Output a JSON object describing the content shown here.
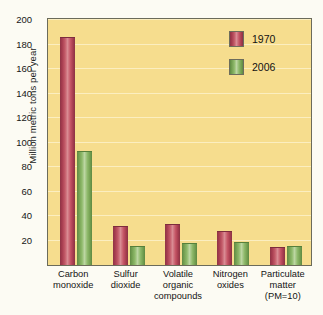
{
  "chart_data": {
    "type": "bar",
    "title": "",
    "subtitle": "",
    "xlabel": "",
    "ylabel": "Million metric tons per year",
    "ylim": [
      0,
      200
    ],
    "yticks": [
      20,
      40,
      60,
      80,
      100,
      120,
      140,
      160,
      180,
      200
    ],
    "grid": true,
    "legend_position": "top-right",
    "categories": [
      "Carbon monoxide",
      "Sulfur dioxide",
      "Volatile organic compounds",
      "Nitrogen oxides",
      "Particulate matter (PM=10)"
    ],
    "category_lines": [
      [
        "Carbon",
        "monoxide"
      ],
      [
        "Sulfur",
        "dioxide"
      ],
      [
        "Volatile",
        "organic",
        "compounds"
      ],
      [
        "Nitrogen",
        "oxides"
      ],
      [
        "Particulate",
        "matter",
        "(PM=10)"
      ]
    ],
    "series": [
      {
        "name": "1970",
        "color": "#b04a5a",
        "values": [
          185,
          31,
          33,
          27,
          14
        ]
      },
      {
        "name": "2006",
        "color": "#7fae5c",
        "values": [
          92,
          15,
          17,
          18,
          15
        ]
      }
    ]
  },
  "legend": {
    "items": [
      {
        "label": "1970",
        "color": "#b04a5a"
      },
      {
        "label": "2006",
        "color": "#7fae5c"
      }
    ]
  },
  "axes": {
    "y_title": "Million metric tons per year",
    "y_tick_labels": [
      "20",
      "40",
      "60",
      "80",
      "100",
      "120",
      "140",
      "160",
      "180",
      "200"
    ]
  },
  "colors": {
    "plot_background": "#f6dd8e",
    "page_background": "#fcfbf3",
    "axis_border": "#6b6b5a",
    "gridline": "#fbeec0",
    "series_1970": "#b04a5a",
    "series_2006": "#7fae5c"
  }
}
